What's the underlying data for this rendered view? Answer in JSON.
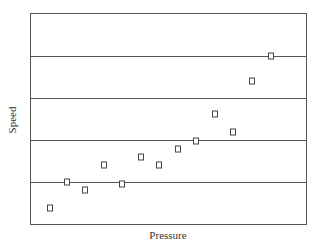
{
  "chart_data": {
    "type": "scatter",
    "title": "",
    "xlabel": "Pressure",
    "ylabel": "Speed",
    "xlim": [
      0,
      10
    ],
    "ylim": [
      0,
      5
    ],
    "grid": "horizontal",
    "y_gridlines": [
      1,
      2,
      3,
      4
    ],
    "legend": null,
    "marker": "open-square",
    "series": [
      {
        "name": "Speed vs Pressure",
        "points": [
          {
            "x": 0.69,
            "y": 0.4
          },
          {
            "x": 1.34,
            "y": 1.0
          },
          {
            "x": 1.99,
            "y": 0.81
          },
          {
            "x": 2.68,
            "y": 1.4
          },
          {
            "x": 3.33,
            "y": 0.97
          },
          {
            "x": 4.02,
            "y": 1.61
          },
          {
            "x": 4.67,
            "y": 1.4
          },
          {
            "x": 5.36,
            "y": 1.8
          },
          {
            "x": 6.01,
            "y": 1.99
          },
          {
            "x": 6.7,
            "y": 2.61
          },
          {
            "x": 7.35,
            "y": 2.2
          },
          {
            "x": 8.01,
            "y": 3.39
          },
          {
            "x": 8.7,
            "y": 4.0
          }
        ]
      }
    ]
  },
  "colors": {
    "frame": "#555555",
    "grid": "#555555",
    "marker_stroke": "#444444",
    "marker_fill": "#ffffff"
  }
}
